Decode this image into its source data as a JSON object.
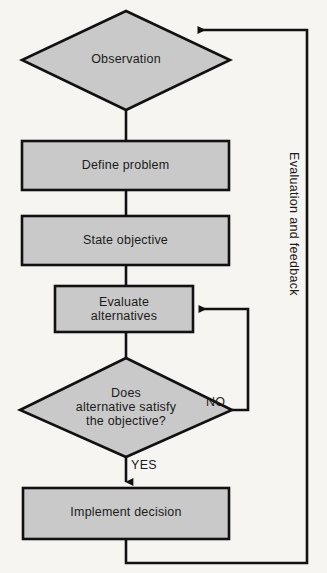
{
  "diagram": {
    "background_color": "#f6f5f2",
    "shape_fill_color": "#c9c9c9",
    "line_color": "#111111",
    "nodes": [
      {
        "id": "observation",
        "type": "diamond",
        "label": "Observation"
      },
      {
        "id": "define-problem",
        "type": "process",
        "label": "Define problem"
      },
      {
        "id": "state-objective",
        "type": "process",
        "label": "State objective"
      },
      {
        "id": "evaluate-alternatives",
        "type": "process",
        "label": "Evaluate\nalternatives"
      },
      {
        "id": "decision",
        "type": "diamond",
        "label": "Does\nalternative satisfy\nthe objective?"
      },
      {
        "id": "implement-decision",
        "type": "process",
        "label": "Implement decision"
      }
    ],
    "edge_labels": {
      "no": "NO",
      "yes": "YES",
      "feedback": "Evaluation and feedback"
    }
  }
}
